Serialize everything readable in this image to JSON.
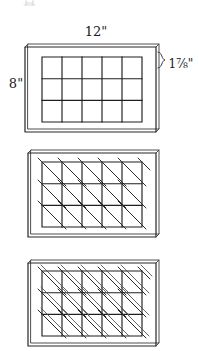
{
  "figure": {
    "background_color": "#ffffff",
    "ink_color": "#262626",
    "labels": {
      "width": "12\"",
      "height": "8\"",
      "cell": "1⅞\""
    },
    "grid": {
      "columns": 5,
      "rows": 3
    },
    "panels": [
      {
        "name": "panel-plain-grid",
        "caption": "",
        "stage": "grid only",
        "diagonals": "none"
      },
      {
        "name": "panel-single-diagonal",
        "caption": "",
        "stage": "grid with single diagonals",
        "diagonals": "single"
      },
      {
        "name": "panel-double-diagonal",
        "caption": "",
        "stage": "grid with double diagonals",
        "diagonals": "double"
      }
    ]
  }
}
